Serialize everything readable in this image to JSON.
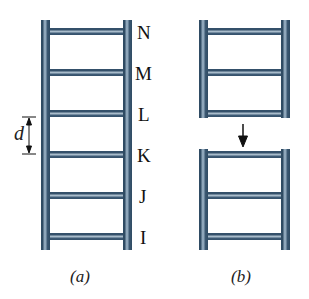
{
  "figure_a": {
    "caption": "(a)",
    "rung_labels": [
      "N",
      "M",
      "L",
      "K",
      "J",
      "I"
    ],
    "spacing_label": "d"
  },
  "figure_b": {
    "caption": "(b)"
  },
  "colors": {
    "ladder": "#34506a",
    "ladder_highlight": "#a9bccb",
    "text": "#111111"
  }
}
